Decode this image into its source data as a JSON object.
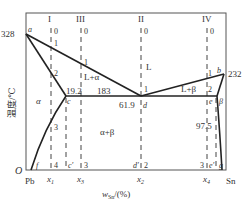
{
  "diagram": {
    "ylabel": "温度/℃",
    "xlabel_main": "w",
    "xlabel_sub": "Sn",
    "xlabel_unit": "/(%)",
    "origin_label": "O",
    "left_element": "Pb",
    "right_element": "Sn",
    "temperatures": {
      "pb_melt": "328",
      "sn_melt": "232",
      "eutectic": "183"
    },
    "compositions": {
      "c": "19.2",
      "d": "61.9",
      "e": "97.5"
    },
    "points": {
      "a": "a",
      "b": "b",
      "c": "c",
      "d": "d",
      "e": "e",
      "f": "f",
      "g": "g",
      "c_prime": "c′",
      "d_prime": "d′",
      "e_prime": "e′"
    },
    "phase_regions": {
      "liquid": "L",
      "alpha": "α",
      "beta": "β",
      "l_alpha": "L+α",
      "l_beta": "L+β",
      "alpha_beta": "α+β"
    },
    "alloys": [
      {
        "id": "I",
        "x_label": "x",
        "x_sub": "1",
        "marks": [
          "0",
          "1",
          "2",
          "3",
          "4"
        ]
      },
      {
        "id": "III",
        "x_label": "x",
        "x_sub": "3",
        "marks": [
          "0",
          "1",
          "2",
          "3"
        ]
      },
      {
        "id": "II",
        "x_label": "x",
        "x_sub": "2",
        "marks": [
          "0",
          "1",
          "2"
        ]
      },
      {
        "id": "IV",
        "x_label": "x",
        "x_sub": "4",
        "marks": [
          "0",
          "1",
          "2",
          "3"
        ]
      }
    ]
  }
}
